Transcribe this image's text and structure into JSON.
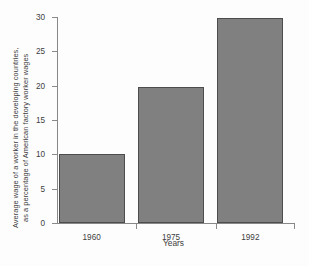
{
  "chart_data": {
    "type": "bar",
    "title": "",
    "categories": [
      "1960",
      "1975",
      "1992"
    ],
    "values": [
      10,
      19.8,
      29.8
    ],
    "xlabel": "Years",
    "ylabel_line1": "Average wage of a worker in the developing countries,",
    "ylabel_line2": "as a percentage of American factory worker wages",
    "ylim": [
      0,
      30
    ],
    "yticks": [
      "0",
      "5",
      "10",
      "15",
      "20",
      "25",
      "30"
    ],
    "ytick_values": [
      0,
      5,
      10,
      15,
      20,
      25,
      30
    ],
    "grid": false,
    "legend": null,
    "bar_color": "#808080",
    "bar_edge_color": "#4d4d4d",
    "axis_color": "#888888",
    "background": "#ffffff"
  }
}
